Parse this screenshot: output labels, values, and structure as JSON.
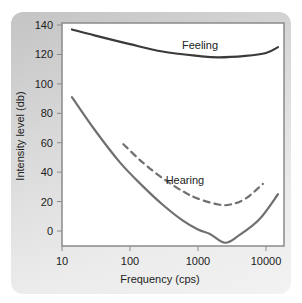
{
  "chart_data": {
    "type": "line",
    "title": "",
    "xlabel": "Frequency (cps)",
    "ylabel": "Intensity level (db)",
    "xscale": "log",
    "xlim": [
      10,
      16000
    ],
    "ylim": [
      -10,
      140
    ],
    "xticks": [
      "10",
      "100",
      "1000",
      "10000"
    ],
    "yticks": [
      "140",
      "120",
      "100",
      "80",
      "60",
      "40",
      "20",
      "0"
    ],
    "grid": false,
    "series": [
      {
        "name": "Feeling",
        "style": "solid",
        "color": "#3a3a3a",
        "x": [
          14,
          30,
          100,
          300,
          1000,
          2000,
          5000,
          10000,
          15000
        ],
        "y": [
          137,
          133,
          127,
          122,
          119,
          118,
          119,
          121,
          125
        ]
      },
      {
        "name": "Hearing",
        "style": "dashed",
        "color": "#707070",
        "x": [
          80,
          150,
          300,
          600,
          1000,
          2000,
          3000,
          5000,
          9000
        ],
        "y": [
          59,
          47,
          36,
          27,
          22,
          18,
          18,
          22,
          32
        ]
      },
      {
        "name": "Hearing threshold (solid)",
        "style": "solid",
        "color": "#707070",
        "x": [
          14,
          30,
          70,
          150,
          300,
          600,
          1000,
          1500,
          2500,
          4000,
          8000,
          15000
        ],
        "y": [
          91,
          69,
          47,
          31,
          18,
          7,
          1,
          -2,
          -8,
          -3,
          8,
          25
        ]
      }
    ],
    "annotations": [
      {
        "text": "Feeling",
        "x": 1000,
        "y": 124
      },
      {
        "text": "Hearing",
        "x": 600,
        "y": 32
      }
    ]
  }
}
